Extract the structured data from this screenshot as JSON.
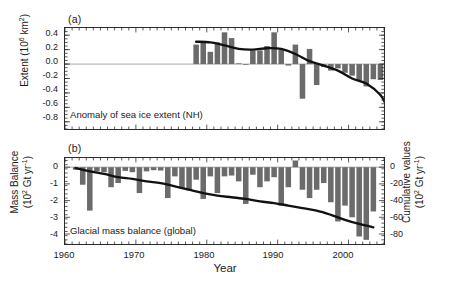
{
  "figure": {
    "width": 449,
    "height": 291,
    "bar_color": "#6b6b6b",
    "line_color": "#111111",
    "axis_color": "#2b2b2b",
    "background": "#ffffff"
  },
  "panels": {
    "a": {
      "label": "(a)",
      "caption": "Anomaly of sea ice extent (NH)",
      "ylabel_main": "Extent (10",
      "ylabel_sup": "6",
      "ylabel_tail": " km",
      "ylabel_sup2": "2",
      "ylabel_close": ")",
      "yticks": [
        "0.4",
        "0.2",
        "0.0",
        "-0.2",
        "-0.4",
        "-0.6",
        "-0.8"
      ]
    },
    "b": {
      "label": "(b)",
      "caption": "Glacial mass balance (global)",
      "ylabel_l1": "Mass Balance",
      "ylabel_l2a": "(10",
      "ylabel_l2sup": "2",
      "ylabel_l2b": " Gt yr",
      "ylabel_l2sup2": "-1",
      "ylabel_l2c": ")",
      "ylabel_r1": "Cumulative values",
      "ylabel_r2a": "(10",
      "ylabel_r2sup": "2",
      "ylabel_r2b": " Gt yr",
      "ylabel_r2sup2": "-1",
      "ylabel_r2c": ")",
      "yticks_left": [
        "0",
        "-1",
        "-2",
        "-3",
        "-4"
      ],
      "yticks_right": [
        "0",
        "-20",
        "-40",
        "-60",
        "-80"
      ]
    }
  },
  "xaxis": {
    "label": "Year",
    "ticks": [
      "1960",
      "1970",
      "1980",
      "1990",
      "2000"
    ],
    "tick_values": [
      1960,
      1970,
      1980,
      1990,
      2000
    ],
    "range": [
      1960,
      2005
    ]
  },
  "chart_data": [
    {
      "type": "bar",
      "id": "panel-a",
      "title": "Anomaly of sea ice extent (NH)",
      "xlabel": "Year",
      "ylabel": "Extent (10^6 km^2)",
      "ylim": [
        -0.9,
        0.5
      ],
      "xlim": [
        1960,
        2005
      ],
      "grid": false,
      "legend": "none",
      "categories": [
        1978,
        1979,
        1980,
        1981,
        1982,
        1983,
        1984,
        1985,
        1986,
        1987,
        1988,
        1989,
        1990,
        1991,
        1992,
        1993,
        1994,
        1995,
        1996,
        1997,
        1998,
        1999,
        2000,
        2001,
        2002,
        2003,
        2004,
        2005
      ],
      "values": [
        0.27,
        0.31,
        0.17,
        0.3,
        0.44,
        0.36,
        0.01,
        -0.01,
        0.19,
        0.19,
        0.25,
        0.44,
        0.2,
        -0.02,
        0.27,
        -0.48,
        0.21,
        -0.29,
        -0.04,
        -0.09,
        -0.06,
        -0.12,
        -0.16,
        -0.23,
        -0.31,
        -0.21,
        -0.22,
        -0.86
      ],
      "series": [
        {
          "name": "smoothed curve",
          "type": "line",
          "x": [
            1978,
            1980,
            1982,
            1984,
            1986,
            1988,
            1990,
            1992,
            1994,
            1996,
            1998,
            2000,
            2002,
            2004,
            2005
          ],
          "values": [
            0.31,
            0.3,
            0.26,
            0.21,
            0.2,
            0.22,
            0.21,
            0.14,
            0.04,
            -0.02,
            -0.09,
            -0.2,
            -0.27,
            -0.43,
            -0.61
          ]
        }
      ]
    },
    {
      "type": "bar",
      "id": "panel-b",
      "title": "Glacial mass balance (global)",
      "xlabel": "Year",
      "ylabel": "Mass Balance (10^2 Gt yr^-1)",
      "ylabel_right": "Cumulative values (10^2 Gt yr^-1)",
      "ylim": [
        -4.6,
        0.55
      ],
      "ylim_right": [
        -92,
        11
      ],
      "xlim": [
        1960,
        2005
      ],
      "grid": false,
      "legend": "none",
      "categories": [
        1961,
        1962,
        1963,
        1964,
        1965,
        1966,
        1967,
        1968,
        1969,
        1970,
        1971,
        1972,
        1973,
        1974,
        1975,
        1976,
        1977,
        1978,
        1979,
        1980,
        1981,
        1982,
        1983,
        1984,
        1985,
        1986,
        1987,
        1988,
        1989,
        1990,
        1991,
        1992,
        1993,
        1994,
        1995,
        1996,
        1997,
        1998,
        1999,
        2000,
        2001,
        2002,
        2003
      ],
      "values": [
        -0.15,
        -1.05,
        -2.6,
        -0.25,
        -0.3,
        -1.2,
        -0.95,
        -0.22,
        -0.3,
        -1.55,
        -0.25,
        -0.18,
        -0.2,
        -1.85,
        -0.55,
        -1.25,
        -1.4,
        -0.75,
        -1.9,
        -0.55,
        -1.55,
        -0.55,
        -0.5,
        -0.85,
        -2.2,
        -0.45,
        -1.2,
        -0.85,
        -0.6,
        -2.3,
        -1.2,
        0.4,
        -1.35,
        -1.85,
        -1.35,
        -0.95,
        -2.1,
        -3.25,
        -2.3,
        -3.0,
        -4.15,
        -4.35,
        -2.65
      ],
      "series": [
        {
          "name": "cumulative curve (right axis)",
          "type": "line",
          "x": [
            1961,
            1963,
            1965,
            1967,
            1969,
            1971,
            1973,
            1975,
            1977,
            1979,
            1981,
            1983,
            1985,
            1987,
            1989,
            1991,
            1993,
            1995,
            1997,
            1999,
            2001,
            2003
          ],
          "values": [
            -1,
            -5,
            -8,
            -12,
            -14,
            -17,
            -19,
            -23,
            -27,
            -31,
            -34,
            -36,
            -38,
            -41,
            -43,
            -46,
            -49,
            -52,
            -57,
            -63,
            -68,
            -72
          ]
        }
      ]
    }
  ]
}
